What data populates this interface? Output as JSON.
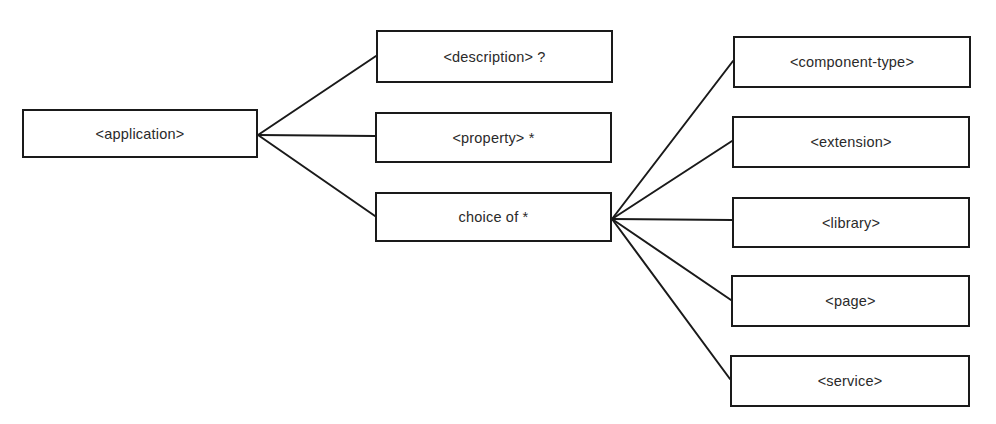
{
  "diagram": {
    "type": "tree",
    "root": {
      "id": "application",
      "label": "<application>",
      "box": {
        "x": 22,
        "y": 109,
        "w": 236,
        "h": 49
      }
    },
    "level1": [
      {
        "id": "description",
        "label": "<description> ?",
        "box": {
          "x": 376,
          "y": 30,
          "w": 237,
          "h": 53
        }
      },
      {
        "id": "property",
        "label": "<property> *",
        "box": {
          "x": 375,
          "y": 112,
          "w": 237,
          "h": 51
        }
      },
      {
        "id": "choice",
        "label": "choice of *",
        "box": {
          "x": 375,
          "y": 192,
          "w": 237,
          "h": 50
        }
      }
    ],
    "level2": [
      {
        "id": "component-type",
        "label": "<component-type>",
        "box": {
          "x": 733,
          "y": 36,
          "w": 238,
          "h": 52
        }
      },
      {
        "id": "extension",
        "label": "<extension>",
        "box": {
          "x": 732,
          "y": 116,
          "w": 238,
          "h": 52
        }
      },
      {
        "id": "library",
        "label": "<library>",
        "box": {
          "x": 732,
          "y": 197,
          "w": 238,
          "h": 51
        }
      },
      {
        "id": "page",
        "label": "<page>",
        "box": {
          "x": 731,
          "y": 275,
          "w": 239,
          "h": 52
        }
      },
      {
        "id": "service",
        "label": "<service>",
        "box": {
          "x": 730,
          "y": 355,
          "w": 240,
          "h": 52
        }
      }
    ],
    "edges": [
      {
        "from": "application",
        "to": "description",
        "x1": 258,
        "y1": 135,
        "x2": 376,
        "y2": 56
      },
      {
        "from": "application",
        "to": "property",
        "x1": 258,
        "y1": 135,
        "x2": 375,
        "y2": 136
      },
      {
        "from": "application",
        "to": "choice",
        "x1": 258,
        "y1": 135,
        "x2": 375,
        "y2": 216
      },
      {
        "from": "choice",
        "to": "component-type",
        "x1": 612,
        "y1": 219,
        "x2": 733,
        "y2": 61
      },
      {
        "from": "choice",
        "to": "extension",
        "x1": 612,
        "y1": 219,
        "x2": 732,
        "y2": 141
      },
      {
        "from": "choice",
        "to": "library",
        "x1": 612,
        "y1": 219,
        "x2": 732,
        "y2": 220
      },
      {
        "from": "choice",
        "to": "page",
        "x1": 612,
        "y1": 219,
        "x2": 731,
        "y2": 300
      },
      {
        "from": "choice",
        "to": "service",
        "x1": 612,
        "y1": 219,
        "x2": 730,
        "y2": 379
      }
    ],
    "colors": {
      "stroke": "#1a1a1a",
      "text": "#2a2a2a",
      "background": "#ffffff"
    }
  }
}
